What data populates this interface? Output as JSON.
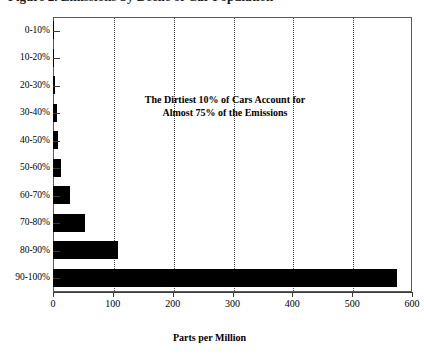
{
  "title_remnant": "Figure 2.  Emissions by Decile of Car Population",
  "annotation_line1": "The Dirtiest 10% of Cars Account for",
  "annotation_line2": "Almost 75% of the Emissions",
  "chart_data": {
    "type": "bar",
    "orientation": "horizontal",
    "title": "",
    "xlabel": "Parts per Million",
    "ylabel": "",
    "categories": [
      "0-10%",
      "10-20%",
      "20-30%",
      "30-40%",
      "40-50%",
      "50-60%",
      "60-70%",
      "70-80%",
      "80-90%",
      "90-100%"
    ],
    "values": [
      1,
      2,
      3,
      6,
      9,
      14,
      28,
      54,
      108,
      575
    ],
    "xlim": [
      0,
      600
    ],
    "xticks": [
      0,
      100,
      200,
      300,
      400,
      500,
      600
    ],
    "gridlines": [
      100,
      200,
      300,
      400,
      500
    ],
    "grid": true,
    "legend": false,
    "bar_color": "#000000",
    "annotations": [
      "The Dirtiest 10% of Cars Account for",
      "Almost 75% of the Emissions"
    ]
  }
}
